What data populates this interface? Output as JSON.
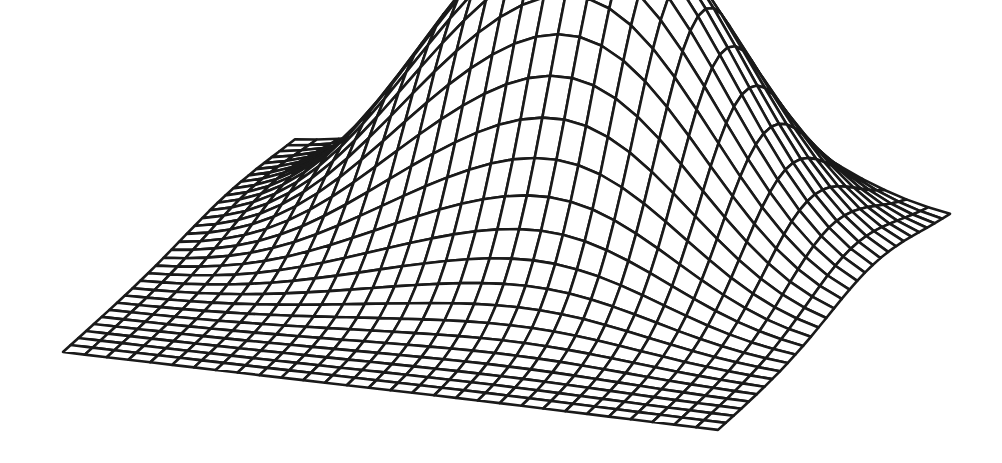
{
  "chart_data": {
    "type": "surface-wireframe",
    "title": "",
    "xlabel": "",
    "ylabel": "",
    "zlabel": "",
    "axes_visible": false,
    "grid": {
      "rows": 30,
      "cols": 30
    },
    "surface": "sum of two Gaussian bumps on a flat square plane",
    "peaks": [
      {
        "name": "left-peak",
        "u": 0.42,
        "v": 0.72,
        "height": 215,
        "sigma_u": 0.17,
        "sigma_v": 0.2
      },
      {
        "name": "right-peak",
        "u": 0.66,
        "v": 0.68,
        "height": 240,
        "sigma_u": 0.16,
        "sigma_v": 0.2
      }
    ],
    "projection": {
      "left_corner": [
        63,
        352
      ],
      "front_corner": [
        718,
        430
      ],
      "right_corner": [
        950,
        221
      ]
    },
    "line_color": "#1a1a1a",
    "fill_color": "#ffffff",
    "line_width": 2.6
  },
  "figure": {
    "background": "#ffffff",
    "width": 1002,
    "height": 463
  }
}
